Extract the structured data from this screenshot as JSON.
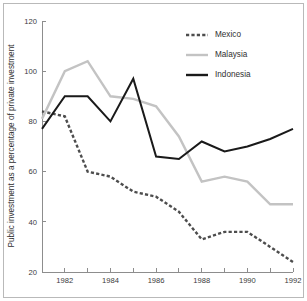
{
  "chart_data": {
    "type": "line",
    "title": "",
    "xlabel": "",
    "ylabel": "Public investment as a percentage of private investment",
    "x": [
      1981,
      1982,
      1983,
      1984,
      1985,
      1986,
      1987,
      1988,
      1989,
      1990,
      1991,
      1992
    ],
    "xlim": [
      1981,
      1992
    ],
    "ylim": [
      20,
      120
    ],
    "grid": false,
    "legend_position": "top-right",
    "x_ticks": [
      1981,
      1982,
      1983,
      1984,
      1985,
      1986,
      1987,
      1988,
      1989,
      1990,
      1991,
      1992
    ],
    "x_tick_labels": [
      "",
      "1982",
      "",
      "1984",
      "",
      "1986",
      "",
      "1988",
      "",
      "1990",
      "",
      "1992"
    ],
    "y_ticks": [
      20,
      40,
      60,
      80,
      100,
      120
    ],
    "y_tick_labels": [
      "20",
      "40",
      "60",
      "80",
      "100",
      "120"
    ],
    "series": [
      {
        "name": "Mexico",
        "color": "#4d4d4d",
        "style": "dashed",
        "values": [
          84,
          82,
          60,
          58,
          52,
          50,
          44,
          33,
          36,
          36,
          30,
          24
        ]
      },
      {
        "name": "Malaysia",
        "color": "#c3c3c3",
        "style": "solid",
        "values": [
          81,
          100,
          104,
          90,
          89,
          86,
          74,
          56,
          58,
          56,
          47,
          47
        ]
      },
      {
        "name": "Indonesia",
        "color": "#1a1a1a",
        "style": "solid",
        "values": [
          77,
          90,
          90,
          80,
          97,
          66,
          65,
          72,
          68,
          70,
          73,
          77
        ]
      }
    ]
  },
  "legend": {
    "entries": [
      {
        "label": "Mexico"
      },
      {
        "label": "Malaysia"
      },
      {
        "label": "Indonesia"
      }
    ]
  },
  "axes": {
    "y_title": "Public investment as a percentage of private investment"
  }
}
